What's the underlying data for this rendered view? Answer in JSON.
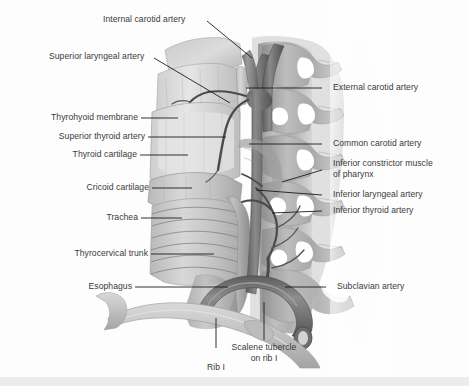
{
  "figure": {
    "background_color": "#fdfdfd",
    "footer_color": "#ececec",
    "label_color": "#3a3a3a",
    "leader_color": "#1c1c1c"
  },
  "labels": {
    "internal_carotid_artery": "Internal carotid artery",
    "superior_laryngeal_artery": "Superior laryngeal artery",
    "thyrohyoid_membrane": "Thyrohyoid membrane",
    "superior_thyroid_artery": "Superior thyroid artery",
    "thyroid_cartilage": "Thyroid cartilage",
    "cricoid_cartilage": "Cricoid cartilage",
    "trachea": "Trachea",
    "thyrocervical_trunk": "Thyrocervical trunk",
    "esophagus": "Esophagus",
    "external_carotid_artery": "External carotid artery",
    "common_carotid_artery": "Common carotid artery",
    "inferior_constrictor_muscle_line1": "Inferior constrictor muscle",
    "inferior_constrictor_muscle_line2": "of pharynx",
    "inferior_laryngeal_artery": "Inferior laryngeal artery",
    "inferior_thyroid_artery": "Inferior thyroid artery",
    "subclavian_artery": "Subclavian artery",
    "scalene_tubercle_line1": "Scalene tubercle",
    "scalene_tubercle_line2": "on rib I",
    "rib_i": "Rib I"
  }
}
